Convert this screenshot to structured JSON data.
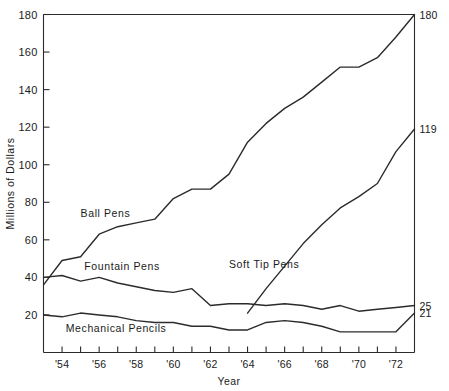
{
  "chart_data": {
    "type": "line",
    "title": "",
    "xlabel": "Year",
    "ylabel": "Millions of Dollars",
    "xlim": [
      1953,
      1973
    ],
    "ylim": [
      0,
      180
    ],
    "grid": false,
    "legend_position": "inline-labels",
    "y_ticks": [
      20,
      40,
      60,
      80,
      100,
      120,
      140,
      160,
      180
    ],
    "y_tick_labels": [
      "20",
      "40",
      "60",
      "80",
      "100",
      "120",
      "140",
      "160",
      "180"
    ],
    "x_ticks": [
      1953,
      1954,
      1955,
      1956,
      1957,
      1958,
      1959,
      1960,
      1961,
      1962,
      1963,
      1964,
      1965,
      1966,
      1967,
      1968,
      1969,
      1970,
      1971,
      1972,
      1973
    ],
    "x_tick_labels": [
      "",
      "'54",
      "",
      "'56",
      "",
      "'58",
      "",
      "'60",
      "",
      "'62",
      "",
      "'64",
      "",
      "'66",
      "",
      "'68",
      "",
      "'70",
      "",
      "'72",
      ""
    ],
    "x": [
      1953,
      1954,
      1955,
      1956,
      1957,
      1958,
      1959,
      1960,
      1961,
      1962,
      1963,
      1964,
      1965,
      1966,
      1967,
      1968,
      1969,
      1970,
      1971,
      1972,
      1973
    ],
    "series": [
      {
        "name": "Ball Pens",
        "values": [
          36,
          49,
          51,
          63,
          67,
          69,
          71,
          82,
          87,
          87,
          95,
          112,
          122,
          130,
          136,
          144,
          152,
          152,
          157,
          168,
          180
        ],
        "end_value": 180,
        "end_label": "180",
        "label_x": 1955.0,
        "label_y": 72
      },
      {
        "name": "Fountain Pens",
        "values": [
          40,
          41,
          38,
          40,
          37,
          35,
          33,
          32,
          34,
          25,
          26,
          26,
          25,
          26,
          25,
          23,
          25,
          22,
          23,
          24,
          25
        ],
        "end_value": 25,
        "end_label": "25",
        "label_x": 1955.2,
        "label_y": 44
      },
      {
        "name": "Soft Tip Pens",
        "values": [
          null,
          null,
          null,
          null,
          null,
          null,
          null,
          null,
          null,
          null,
          null,
          21,
          34,
          46,
          58,
          68,
          77,
          83,
          90,
          107,
          119
        ],
        "end_value": 119,
        "end_label": "119",
        "label_x": 1963.0,
        "label_y": 45
      },
      {
        "name": "Mechanical Pencils",
        "values": [
          20,
          19,
          21,
          20,
          19,
          17,
          16,
          16,
          14,
          14,
          12,
          12,
          16,
          17,
          16,
          14,
          11,
          11,
          11,
          11,
          21
        ],
        "end_value": 21,
        "end_label": "21",
        "label_x": 1954.2,
        "label_y": 11
      }
    ]
  }
}
